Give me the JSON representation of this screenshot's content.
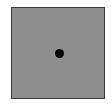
{
  "scene": {
    "background_color": "#ffffff",
    "square": {
      "fill_color": "#8e8e8e",
      "border_color": "#3a3a3a"
    },
    "dot": {
      "color": "#050505",
      "shape": "circle"
    }
  }
}
